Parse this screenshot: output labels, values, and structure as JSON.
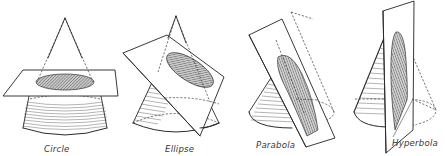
{
  "figure": {
    "background": "#ffffff",
    "ink_color": "#2a2a2a",
    "section_fill": "#9a9a9a",
    "panels": [
      {
        "id": "circle",
        "label": "Circle",
        "label_pos": [
          44,
          152
        ],
        "cut": "plane perpendicular to the cone axis",
        "apex": [
          65,
          20
        ],
        "base_center": [
          65,
          128
        ],
        "base_rx": 42,
        "base_ry": 10,
        "plane": [
          [
            23,
            70
          ],
          [
            115,
            70
          ],
          [
            118,
            96
          ],
          [
            3,
            96
          ]
        ],
        "section": {
          "cx": 65,
          "cy": 82,
          "rx": 29,
          "ry": 8
        }
      },
      {
        "id": "ellipse",
        "label": "Ellipse",
        "label_pos": [
          165,
          152
        ],
        "cut": "inclined plane crossing all generators",
        "apex": [
          176,
          18
        ],
        "base_center": [
          176,
          123
        ],
        "base_rx": 43,
        "base_ry": 11,
        "plane": [
          [
            123,
            53
          ],
          [
            167,
            35
          ],
          [
            224,
            77
          ],
          [
            200,
            136
          ]
        ],
        "section": {
          "cx": 190,
          "cy": 70,
          "rx": 27,
          "ry": 11,
          "rotate": 33
        }
      },
      {
        "id": "parabola",
        "label": "Parabola",
        "label_pos": [
          256,
          148
        ],
        "cut": "plane parallel to a generator",
        "apex": [
          291,
          14
        ],
        "base_center": [
          291,
          112
        ],
        "base_rx": 43,
        "base_ry": 12,
        "plane": [
          [
            249,
            35
          ],
          [
            282,
            19
          ],
          [
            335,
            138
          ],
          [
            306,
            147
          ]
        ]
      },
      {
        "id": "hyperbola",
        "label": "Hyperbola",
        "label_pos": [
          392,
          146
        ],
        "cut": "plane parallel to the cone axis",
        "apex": [
          394,
          13
        ],
        "base_center": [
          394,
          103
        ],
        "base_rx": 41,
        "base_ry": 13,
        "plane": [
          [
            383,
            11
          ],
          [
            414,
            1
          ],
          [
            413,
            130
          ],
          [
            386,
            153
          ]
        ]
      }
    ]
  }
}
